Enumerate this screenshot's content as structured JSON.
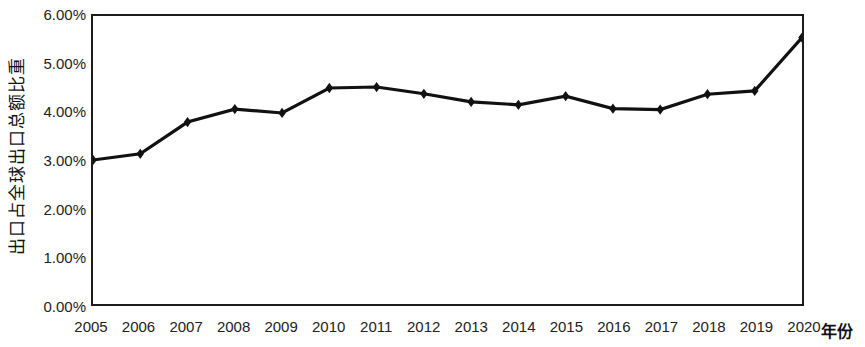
{
  "chart_data": {
    "type": "line",
    "title": "",
    "xlabel": "年份",
    "ylabel": "出口占全球出口总额比重",
    "categories": [
      "2005",
      "2006",
      "2007",
      "2008",
      "2009",
      "2010",
      "2011",
      "2012",
      "2013",
      "2014",
      "2015",
      "2016",
      "2017",
      "2018",
      "2019",
      "2020"
    ],
    "values": [
      3.0,
      3.13,
      3.79,
      4.06,
      3.98,
      4.5,
      4.52,
      4.38,
      4.21,
      4.15,
      4.33,
      4.07,
      4.05,
      4.37,
      4.44,
      5.55
    ],
    "value_unit": "%",
    "ylim": [
      0,
      6
    ],
    "ytick_values": [
      0,
      1,
      2,
      3,
      4,
      5,
      6
    ],
    "ytick_labels": [
      "0.00%",
      "1.00%",
      "2.00%",
      "3.00%",
      "4.00%",
      "5.00%",
      "6.00%"
    ],
    "xtick_labels": [
      "2005",
      "2006",
      "2007",
      "2008",
      "2009",
      "2010",
      "2011",
      "2012",
      "2013",
      "2014",
      "2015",
      "2016",
      "2017",
      "2018",
      "2019",
      "2020"
    ],
    "grid": false,
    "legend": "none",
    "series": [
      {
        "name": "出口占全球出口总额比重",
        "values": [
          3.0,
          3.13,
          3.79,
          4.06,
          3.98,
          4.5,
          4.52,
          4.38,
          4.21,
          4.15,
          4.33,
          4.07,
          4.05,
          4.37,
          4.44,
          5.55
        ],
        "color": "#111111",
        "marker": "diamond",
        "line_width": 3
      }
    ]
  },
  "axes": {
    "y_title": "出口占全球出口总额比重",
    "x_title": "年份",
    "border_color": "#1c1c1c",
    "plot_background": "#ffffff"
  }
}
